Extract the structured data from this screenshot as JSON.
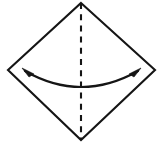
{
  "figure": {
    "title": "Origami fold step diagram",
    "background_color": "#ffffff",
    "ink_color": "#151515",
    "canvas": {
      "width": 162,
      "height": 147
    }
  },
  "shapes": {
    "diamond": {
      "name": "paper-sheet",
      "label": "Square sheet rotated 45 degrees",
      "stroke_color": "#151515",
      "stroke_width": 2.1,
      "fill": "none",
      "vertices": {
        "top": {
          "x": 81,
          "y": 3
        },
        "right": {
          "x": 155,
          "y": 70
        },
        "bottom": {
          "x": 81,
          "y": 140
        },
        "left": {
          "x": 8,
          "y": 70
        }
      },
      "points": "81,3 155,70 81,140 8,70"
    },
    "fold_line": {
      "name": "vertical-fold-crease",
      "label": "Vertical dashed fold line",
      "style": "dashed",
      "stroke_color": "#151515",
      "stroke_width": 2.1,
      "dash_length": 6,
      "dash_gap": 5.2,
      "start": {
        "x": 81,
        "y": 3
      },
      "end": {
        "x": 81,
        "y": 140
      }
    },
    "motion_arc": {
      "name": "fold-direction-arrow",
      "label": "Curved double-headed arrow showing fold direction",
      "stroke_color": "#151515",
      "stroke_width": 2.2,
      "arrowheads": "both",
      "path": "M 25,71 Q 81,103 138,71",
      "left_tip": {
        "x": 22,
        "y": 68
      },
      "right_tip": {
        "x": 141,
        "y": 68
      },
      "left_head_points": "22,68 34,74 29,77",
      "right_head_points": "141,68 129,74 134,77"
    }
  }
}
